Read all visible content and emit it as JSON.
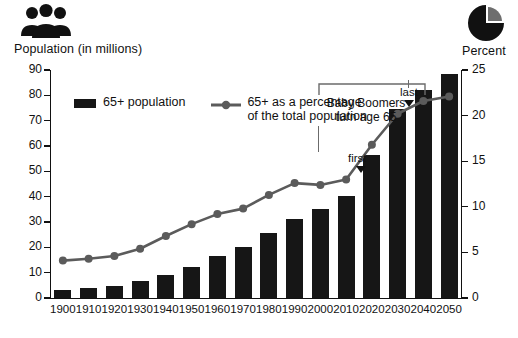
{
  "icons": {
    "people": "people-group-icon",
    "pie": "pie-chart-icon"
  },
  "left_axis_title": "Population (in millions)",
  "right_axis_title": "Percent",
  "legend": {
    "bar_label": "65+ population",
    "line_label_line1": "65+ as a percentage",
    "line_label_line2": "of the total population"
  },
  "annotation": {
    "line1": "Baby Boomers",
    "line2": "turn age 65",
    "first": "first",
    "last": "last"
  },
  "colors": {
    "bar": "#161616",
    "line": "#5b5b5b",
    "axis": "#111111",
    "background": "#ffffff"
  },
  "chart_data": {
    "type": "bar",
    "title": "",
    "xlabel": "",
    "categories": [
      "1900",
      "1910",
      "1920",
      "1930",
      "1940",
      "1950",
      "1960",
      "1970",
      "1980",
      "1990",
      "2000",
      "2010",
      "2020",
      "2030",
      "2040",
      "2050"
    ],
    "series": [
      {
        "name": "65+ population",
        "type": "bar",
        "axis": "left",
        "unit": "millions",
        "values": [
          3.1,
          4.0,
          4.9,
          6.6,
          9.0,
          12.4,
          16.6,
          20.1,
          25.5,
          31.2,
          35.0,
          40.2,
          56.4,
          74.6,
          82.3,
          88.5
        ]
      },
      {
        "name": "65+ as a percentage of the total population",
        "type": "line",
        "axis": "right",
        "unit": "percent",
        "values": [
          4.1,
          4.3,
          4.6,
          5.4,
          6.8,
          8.1,
          9.2,
          9.8,
          11.3,
          12.6,
          12.4,
          13.0,
          16.8,
          20.2,
          21.6,
          22.1
        ]
      }
    ],
    "left_axis": {
      "label": "Population (in millions)",
      "ticks": [
        0,
        10,
        20,
        30,
        40,
        50,
        60,
        70,
        80,
        90
      ],
      "ylim": [
        0,
        90
      ]
    },
    "right_axis": {
      "label": "Percent",
      "ticks": [
        0,
        5,
        10,
        15,
        20,
        25
      ],
      "ylim": [
        0,
        25
      ]
    },
    "grid": false,
    "legend_position": "top-left",
    "annotations": [
      {
        "text": "Baby Boomers turn age 65",
        "points": [
          "first",
          "last"
        ],
        "first_year": "2010",
        "last_year": "2030"
      }
    ]
  }
}
